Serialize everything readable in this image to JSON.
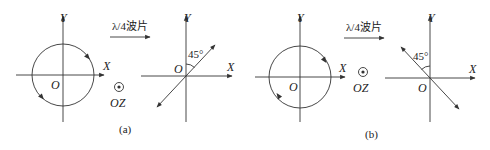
{
  "figure": {
    "panels": [
      {
        "id": "a",
        "caption": "(a)",
        "input": {
          "x_label": "X",
          "y_label": "Y",
          "origin_label": "O",
          "shape": "circle",
          "rotation": "mixed-arrows"
        },
        "operator": {
          "label": "λ/4波片"
        },
        "propagation": {
          "symbol": "dot-in-circle",
          "label": "OZ"
        },
        "output": {
          "x_label": "X",
          "y_label": "Y",
          "origin_label": "O",
          "angle_label": "45°",
          "line_orientation": "+45° (first/third quadrant)"
        }
      },
      {
        "id": "b",
        "caption": "(b)",
        "input": {
          "x_label": "X",
          "y_label": "Y",
          "origin_label": "O",
          "shape": "circle",
          "rotation": "clockwise"
        },
        "operator": {
          "label": "λ/4波片"
        },
        "propagation": {
          "symbol": "dot-in-circle",
          "label": "OZ"
        },
        "output": {
          "x_label": "X",
          "y_label": "Y",
          "origin_label": "O",
          "angle_label": "45°",
          "line_orientation": "-45° (second/fourth quadrant)"
        }
      }
    ]
  },
  "colors": {
    "line": "#333333",
    "background": "#ffffff"
  }
}
